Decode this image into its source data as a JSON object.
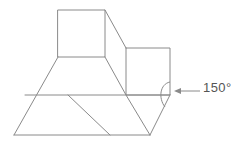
{
  "figure": {
    "type": "geometry-line-drawing",
    "stroke_color": "#8a8a8a",
    "text_color": "#555555",
    "background_color": "#ffffff",
    "stroke_width": 1,
    "annotation": {
      "label": "150°",
      "value": 150,
      "unit": "degrees",
      "arrow_direction": "left",
      "leader_line_from_x": 200,
      "leader_line_to_x": 176,
      "leader_line_y": 91,
      "arc_vertex_x": 170,
      "arc_vertex_y": 95
    },
    "vertices": {
      "top_box_top_left": [
        58,
        10
      ],
      "top_box_top_right": [
        105,
        10
      ],
      "top_box_bottom_right": [
        105,
        57
      ],
      "top_box_bottom_left": [
        58,
        57
      ],
      "right_box_top_left": [
        126,
        48
      ],
      "right_box_top_right": [
        170,
        48
      ],
      "right_box_bottom_right": [
        170,
        95
      ],
      "right_box_bottom_left": [
        126,
        95
      ],
      "base_bottom_left": [
        14,
        135
      ],
      "base_bottom_mid": [
        110,
        135
      ],
      "base_bottom_right": [
        150,
        135
      ],
      "mid_line_left": [
        25,
        95
      ],
      "mid_line_right": [
        170,
        95
      ]
    },
    "edges": [
      {
        "name": "top-box-top",
        "from": [
          58,
          10
        ],
        "to": [
          105,
          10
        ]
      },
      {
        "name": "top-box-left",
        "from": [
          58,
          10
        ],
        "to": [
          58,
          57
        ]
      },
      {
        "name": "top-box-right",
        "from": [
          105,
          10
        ],
        "to": [
          105,
          57
        ]
      },
      {
        "name": "top-box-bottom",
        "from": [
          58,
          57
        ],
        "to": [
          105,
          57
        ]
      },
      {
        "name": "upper-slant-right",
        "from": [
          105,
          10
        ],
        "to": [
          126,
          48
        ]
      },
      {
        "name": "right-box-top",
        "from": [
          126,
          48
        ],
        "to": [
          170,
          48
        ]
      },
      {
        "name": "right-box-right",
        "from": [
          170,
          48
        ],
        "to": [
          170,
          95
        ]
      },
      {
        "name": "right-box-left",
        "from": [
          126,
          48
        ],
        "to": [
          126,
          95
        ]
      },
      {
        "name": "right-box-bottom",
        "from": [
          126,
          95
        ],
        "to": [
          170,
          95
        ]
      },
      {
        "name": "left-slant",
        "from": [
          58,
          57
        ],
        "to": [
          14,
          135
        ]
      },
      {
        "name": "inner-slant-from-top-box",
        "from": [
          105,
          57
        ],
        "to": [
          126,
          95
        ]
      },
      {
        "name": "mid-horizontal",
        "from": [
          25,
          95
        ],
        "to": [
          170,
          95
        ]
      },
      {
        "name": "base-bottom",
        "from": [
          14,
          135
        ],
        "to": [
          150,
          135
        ]
      },
      {
        "name": "base-diagonal-left",
        "from": [
          68,
          95
        ],
        "to": [
          110,
          135
        ]
      },
      {
        "name": "base-diagonal-right",
        "from": [
          126,
          95
        ],
        "to": [
          150,
          135
        ]
      },
      {
        "name": "base-diagonal-far-right",
        "from": [
          170,
          95
        ],
        "to": [
          150,
          135
        ]
      }
    ]
  }
}
